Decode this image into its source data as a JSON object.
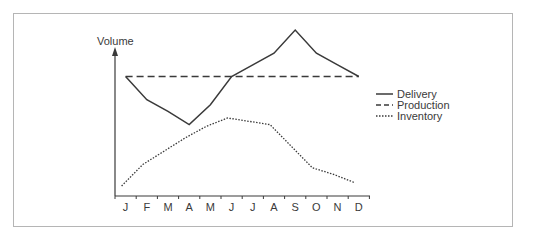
{
  "chart_data": {
    "type": "line",
    "title": "",
    "xlabel": "",
    "ylabel": "Volume",
    "categories": [
      "J",
      "F",
      "M",
      "A",
      "M",
      "J",
      "J",
      "A",
      "S",
      "O",
      "N",
      "D"
    ],
    "series": [
      {
        "name": "Delivery",
        "style": "solid",
        "values": [
          72,
          58,
          51,
          43,
          55,
          72,
          79,
          86,
          100,
          86,
          79,
          72
        ]
      },
      {
        "name": "Production",
        "style": "dashed",
        "values": [
          72,
          72,
          72,
          72,
          72,
          72,
          72,
          72,
          72,
          72,
          72,
          72
        ]
      },
      {
        "name": "Inventory",
        "style": "dotted",
        "values": [
          6,
          19,
          27,
          35,
          42,
          47,
          45,
          43,
          30,
          17,
          13,
          8
        ]
      }
    ],
    "ylim": [
      0,
      100
    ],
    "grid": false,
    "y_ticks_shown": false,
    "legend_position": "right",
    "line_color": "#3a3a3a"
  },
  "legend": {
    "items": [
      {
        "label": "Delivery",
        "style": "solid"
      },
      {
        "label": "Production",
        "style": "dashed"
      },
      {
        "label": "Inventory",
        "style": "dotted"
      }
    ]
  },
  "axis": {
    "ylabel": "Volume",
    "months": [
      "J",
      "F",
      "M",
      "A",
      "M",
      "J",
      "J",
      "A",
      "S",
      "O",
      "N",
      "D"
    ]
  }
}
